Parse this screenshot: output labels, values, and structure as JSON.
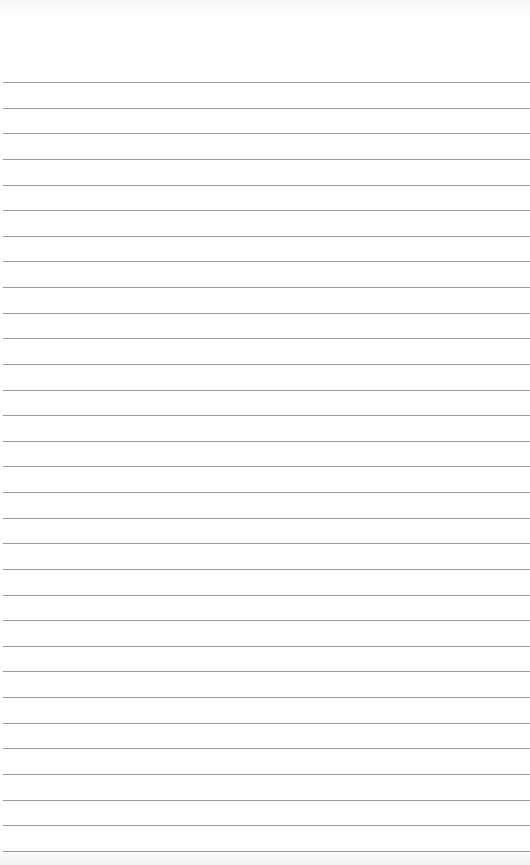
{
  "paper": {
    "type": "lined-paper",
    "line_count": 31,
    "first_line_y": 82,
    "line_spacing": 25.63,
    "line_color": "#9a9a9a",
    "background_color": "#ffffff"
  }
}
